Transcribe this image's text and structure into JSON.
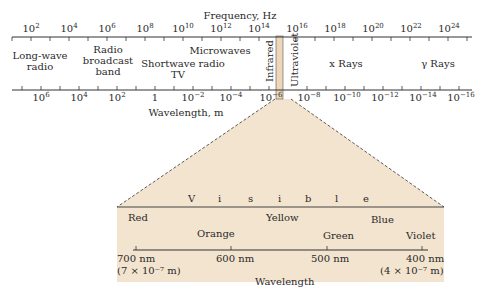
{
  "diagram": {
    "title_top": "Frequency, Hz",
    "title_bottom": "Wavelength, m",
    "frequency_ticks": [
      {
        "base": "10",
        "exp": "2"
      },
      {
        "base": "10",
        "exp": "4"
      },
      {
        "base": "10",
        "exp": "6"
      },
      {
        "base": "10",
        "exp": "8"
      },
      {
        "base": "10",
        "exp": "10"
      },
      {
        "base": "10",
        "exp": "12"
      },
      {
        "base": "10",
        "exp": "14"
      },
      {
        "base": "10",
        "exp": "16"
      },
      {
        "base": "10",
        "exp": "18"
      },
      {
        "base": "10",
        "exp": "20"
      },
      {
        "base": "10",
        "exp": "22"
      },
      {
        "base": "10",
        "exp": "24"
      }
    ],
    "wavelength_ticks": [
      {
        "base": "10",
        "exp": "6"
      },
      {
        "base": "10",
        "exp": "4"
      },
      {
        "base": "10",
        "exp": "2"
      },
      {
        "base": "1",
        "exp": ""
      },
      {
        "base": "10",
        "exp": "−2"
      },
      {
        "base": "10",
        "exp": "−4"
      },
      {
        "base": "10",
        "exp": "−6"
      },
      {
        "base": "10",
        "exp": "−8"
      },
      {
        "base": "10",
        "exp": "−10"
      },
      {
        "base": "10",
        "exp": "−12"
      },
      {
        "base": "10",
        "exp": "−14"
      },
      {
        "base": "10",
        "exp": "−16"
      }
    ],
    "bands": {
      "long_wave_1": "Long-wave",
      "long_wave_2": "radio",
      "radio_1": "Radio",
      "radio_2": "broadcast",
      "radio_3": "band",
      "shortwave": "Shortwave radio",
      "tv": "TV",
      "microwaves": "Microwaves",
      "infrared": "Infrared",
      "ultraviolet": "Ultraviolet",
      "xrays": "x Rays",
      "gamma": "γ Rays"
    },
    "visible": {
      "letters": [
        "V",
        "i",
        "s",
        "i",
        "b",
        "l",
        "e"
      ],
      "colors": {
        "red": "Red",
        "orange": "Orange",
        "yellow": "Yellow",
        "green": "Green",
        "blue": "Blue",
        "violet": "Violet"
      },
      "ticks": {
        "nm700": "700 nm",
        "nm700_sci": "(7 × 10⁻⁷ m)",
        "nm600": "600 nm",
        "nm500": "500 nm",
        "nm400": "400 nm",
        "nm400_sci": "(4 × 10⁻⁷ m)"
      },
      "axis_label": "Wavelength"
    },
    "colors": {
      "ink": "#2a2a2a",
      "visible_fill": "#f3e4cf",
      "visible_strip": "#eed7b8"
    }
  }
}
